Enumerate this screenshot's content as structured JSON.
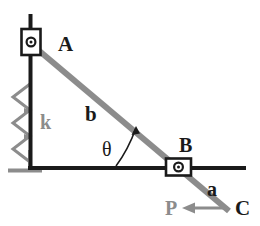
{
  "figure": {
    "background_color": "#ffffff",
    "width": 260,
    "height": 226,
    "colors": {
      "black": "#1a1a1a",
      "dark": "#262626",
      "gray": "#8c8c8c",
      "gray_light": "#a6a6a6",
      "white": "#ffffff"
    }
  },
  "labels": {
    "joint_a": "A",
    "joint_b": "B",
    "point_c": "C",
    "spring_k": "k",
    "link_b": "b",
    "link_a": "a",
    "force_p": "P",
    "angle_theta": "θ"
  },
  "elements": {
    "vertical_guide": {
      "name": "vertical-column-guide",
      "x": 30,
      "y_top": 14,
      "y_bottom": 170,
      "color": "#1a1a1a",
      "thickness": 4
    },
    "horizontal_guide": {
      "name": "horizontal-ground-guide",
      "y": 168,
      "x_left": 30,
      "x_right": 246,
      "color": "#1a1a1a",
      "thickness": 4
    },
    "ground_base": {
      "name": "ground-support-base",
      "x_left": 8,
      "x_right": 42,
      "y": 170,
      "color": "#8c8c8c",
      "thickness": 4
    },
    "spring": {
      "name": "coil-spring",
      "color": "#8c8c8c",
      "x_peak_left": 12,
      "x_peak_right": 32,
      "y_top": 86,
      "y_bottom": 160,
      "coils": 3,
      "label_x": 44,
      "label_y": 122
    },
    "slider_a": {
      "name": "slider-block-a",
      "cx": 31,
      "cy": 42,
      "width": 19,
      "height": 26,
      "pin_radius": 4.5
    },
    "slider_b": {
      "name": "slider-block-b",
      "cx": 178,
      "cy": 167,
      "width": 25,
      "height": 17,
      "pin_radius": 4.5
    },
    "link_ac": {
      "name": "connecting-rod-a-to-c",
      "x1": 38,
      "y1": 50,
      "x2": 228,
      "y2": 210,
      "color": "#8c8c8c",
      "thickness": 6
    },
    "force_arrow": {
      "name": "applied-force-arrow-p",
      "x_tail": 228,
      "x_head": 183,
      "y": 208,
      "color": "#8c8c8c"
    },
    "theta_arc": {
      "name": "angle-arc-theta",
      "color": "#1a1a1a"
    }
  },
  "label_positions": {
    "A": {
      "x": 58,
      "y": 45
    },
    "B": {
      "x": 180,
      "y": 144
    },
    "C": {
      "x": 241,
      "y": 207
    },
    "k": {
      "x": 46,
      "y": 122
    },
    "b": {
      "x": 92,
      "y": 113
    },
    "a": {
      "x": 213,
      "y": 189
    },
    "P": {
      "x": 172,
      "y": 208
    },
    "theta": {
      "x": 109,
      "y": 148
    }
  }
}
